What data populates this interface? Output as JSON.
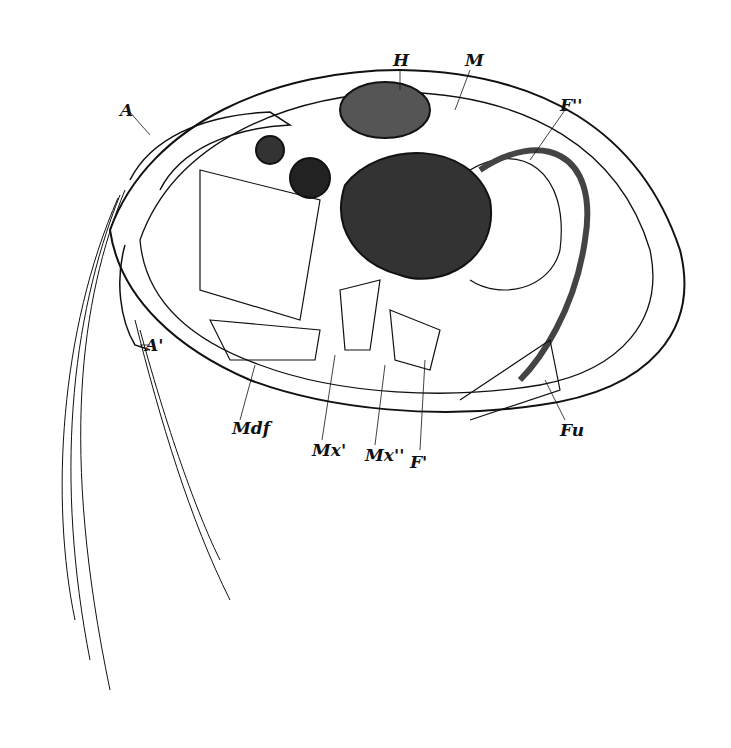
{
  "figure": {
    "labels": [
      {
        "id": "A",
        "text": "A",
        "x": 120,
        "y": 100
      },
      {
        "id": "H",
        "text": "H",
        "x": 393,
        "y": 60
      },
      {
        "id": "M",
        "text": "M",
        "x": 465,
        "y": 60
      },
      {
        "id": "F2",
        "text": "F''",
        "x": 560,
        "y": 100
      },
      {
        "id": "A2",
        "text": "A'",
        "x": 145,
        "y": 340
      },
      {
        "id": "Mdf",
        "text": "Mdf",
        "x": 232,
        "y": 423
      },
      {
        "id": "Mx1",
        "text": "Mx'",
        "x": 315,
        "y": 446
      },
      {
        "id": "Mx2",
        "text": "Mx''",
        "x": 365,
        "y": 450
      },
      {
        "id": "F1",
        "text": "F'",
        "x": 410,
        "y": 455
      },
      {
        "id": "Fu",
        "text": "Fu",
        "x": 560,
        "y": 425
      }
    ]
  }
}
